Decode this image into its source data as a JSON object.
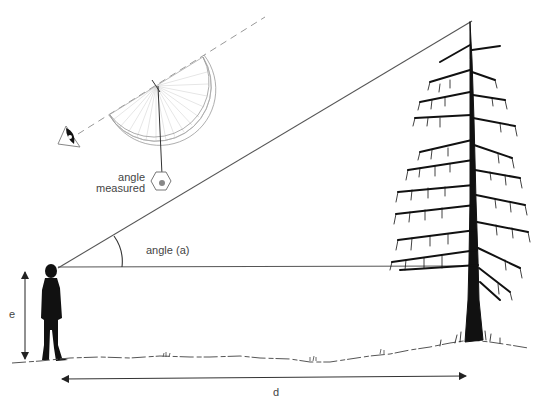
{
  "diagram": {
    "labels": {
      "angle_measured_line1": "angle",
      "angle_measured_line2": "measured",
      "angle_a": "angle (a)",
      "eye_height": "e",
      "distance": "d"
    },
    "elements": [
      {
        "id": "observer",
        "desc": "silhouette of a person standing on the ground"
      },
      {
        "id": "tree",
        "desc": "tall conifer tree"
      },
      {
        "id": "sight-line",
        "desc": "line from observer's eye to tree top"
      },
      {
        "id": "horizontal-line",
        "desc": "horizontal line from eye level to tree"
      },
      {
        "id": "protractor-clinometer",
        "desc": "protractor with plumb bob, sighted by eye along dashed line"
      },
      {
        "id": "eye-height-arrow",
        "desc": "vertical double arrow labeled e"
      },
      {
        "id": "distance-arrow",
        "desc": "horizontal double arrow labeled d"
      }
    ],
    "colors": {
      "ink": "#111111",
      "line": "#555555",
      "light": "#aaaaaa"
    }
  }
}
